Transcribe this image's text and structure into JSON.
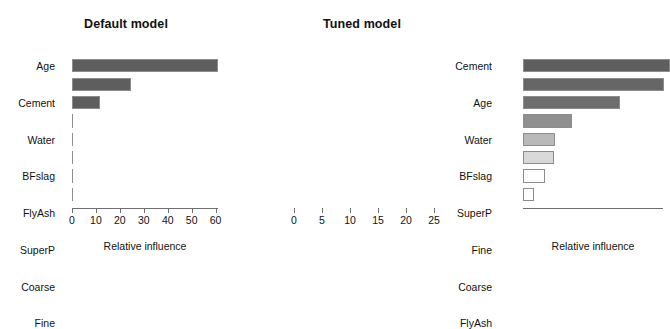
{
  "chart_data": [
    {
      "type": "bar",
      "orientation": "horizontal",
      "title": "Default model",
      "xlabel": "Relative influence",
      "ylabel": "",
      "categories": [
        "Age",
        "Cement",
        "Water",
        "BFslag",
        "FlyAsh",
        "SuperP",
        "Coarse",
        "Fine"
      ],
      "values": [
        61.0,
        24.5,
        11.8,
        0,
        0,
        0,
        0,
        0
      ],
      "xlim": [
        0,
        61
      ],
      "xticks": [
        0,
        10,
        20,
        30,
        40,
        50,
        60
      ],
      "xticklabels": [
        "0",
        "10",
        "20",
        "30",
        "40",
        "50",
        "60"
      ],
      "grid": false,
      "legend": "none",
      "bar_colors": [
        "#5e5e5e",
        "#5e5e5e",
        "#5e5e5e",
        "#5e5e5e",
        "#5e5e5e",
        "#5e5e5e",
        "#5e5e5e",
        "#5e5e5e"
      ]
    },
    {
      "type": "bar",
      "orientation": "horizontal",
      "title": "Tuned model",
      "xlabel": "Relative influence",
      "ylabel": "",
      "categories": [
        "Cement",
        "Age",
        "Water",
        "BFslag",
        "SuperP",
        "Fine",
        "Coarse",
        "FlyAsh"
      ],
      "values": [
        26.3,
        25.2,
        17.4,
        8.8,
        5.8,
        5.6,
        3.9,
        2.0
      ],
      "xlim": [
        0,
        25
      ],
      "xticks": [
        0,
        5,
        10,
        15,
        20,
        25
      ],
      "xticklabels": [
        "0",
        "5",
        "10",
        "15",
        "20",
        "25"
      ],
      "grid": false,
      "legend": "none",
      "bar_colors": [
        "#5e5e5e",
        "#666666",
        "#6e6e6e",
        "#8f8f8f",
        "#b9b9b9",
        "#d9d9d9",
        "#ffffff",
        "#ffffff"
      ]
    }
  ],
  "left_panel": {
    "title": "Default model",
    "axis_title": "Relative influence",
    "categories": [
      "Age",
      "Cement",
      "Water",
      "BFslag",
      "FlyAsh",
      "SuperP",
      "Coarse",
      "Fine"
    ],
    "tick_labels": [
      "0",
      "10",
      "20",
      "30",
      "40",
      "50",
      "60"
    ]
  },
  "right_panel": {
    "title": "Tuned model",
    "axis_title": "Relative influence",
    "categories": [
      "Cement",
      "Age",
      "Water",
      "BFslag",
      "SuperP",
      "Fine",
      "Coarse",
      "FlyAsh"
    ],
    "tick_labels": [
      "0",
      "5",
      "10",
      "15",
      "20",
      "25"
    ]
  }
}
